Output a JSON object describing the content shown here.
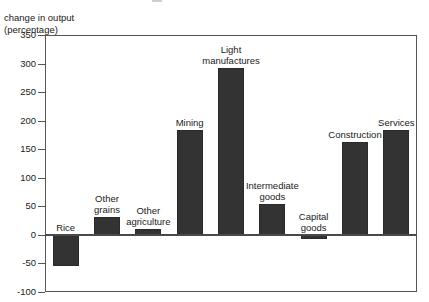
{
  "axis_caption": "change in output\n(percentage)",
  "chart_data": {
    "type": "bar",
    "title": "",
    "subtitle": "",
    "xlabel": "",
    "ylabel": "change in output (percentage)",
    "ylim": [
      -100,
      350
    ],
    "ytick_labels": [
      "350",
      "300",
      "250",
      "200",
      "150",
      "100",
      "50",
      "0",
      "-50",
      "-100"
    ],
    "ytick_values": [
      350,
      300,
      250,
      200,
      150,
      100,
      50,
      0,
      -50,
      -100
    ],
    "grid": false,
    "legend": "none",
    "bar_color": "#333333",
    "categories": [
      "Rice",
      "Other\ngrains",
      "Other\nagriculture",
      "Mining",
      "Light\nmanufactures",
      "Intermediate\ngoods",
      "Capital\ngoods",
      "Construction",
      "Services"
    ],
    "values": [
      -55,
      32,
      11,
      183,
      292,
      54,
      -8,
      162,
      183
    ]
  }
}
